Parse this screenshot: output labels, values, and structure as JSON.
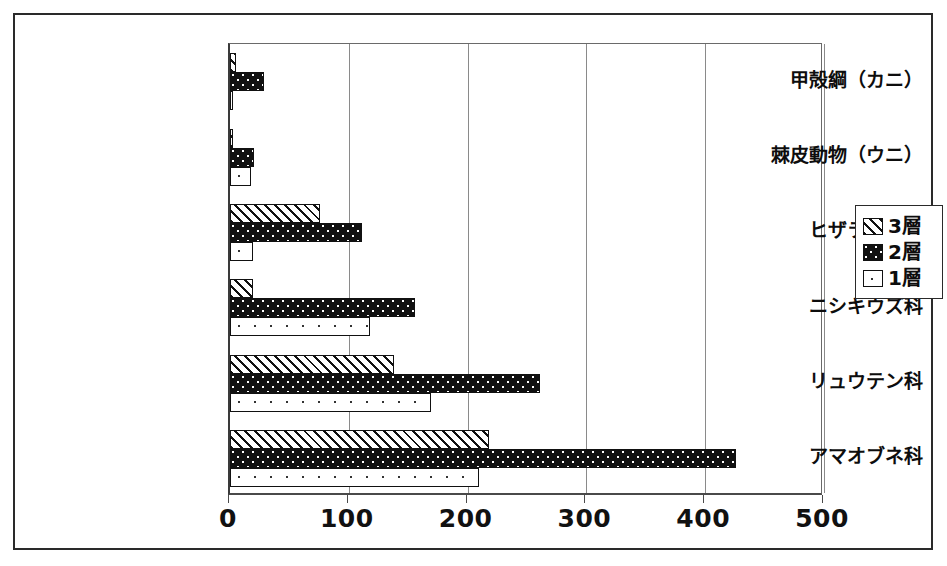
{
  "chart_data": {
    "type": "bar",
    "orientation": "horizontal",
    "title": "",
    "xlabel": "",
    "ylabel": "",
    "xlim": [
      0,
      500
    ],
    "xticks": [
      0,
      100,
      200,
      300,
      400,
      500
    ],
    "xtick_labels": [
      "0",
      "100",
      "200",
      "300",
      "400",
      "500"
    ],
    "grid": true,
    "grid_axis": "x",
    "legend_position": "right",
    "categories": [
      "甲殻綱（カニ）",
      "棘皮動物（ウニ）",
      "ヒザラガイ科",
      "ニシキウズ科",
      "リュウテン科",
      "アマオブネ科"
    ],
    "series": [
      {
        "name": "3層",
        "pattern": "diagonal-hatch",
        "values": [
          5,
          2,
          76,
          19,
          138,
          218
        ]
      },
      {
        "name": "2層",
        "pattern": "black-dotted",
        "values": [
          29,
          20,
          111,
          156,
          261,
          426
        ]
      },
      {
        "name": "1層",
        "pattern": "white-sparse-dots",
        "values": [
          2,
          18,
          19,
          118,
          169,
          210
        ]
      }
    ]
  },
  "legend": {
    "items": [
      {
        "label": "3層",
        "pattern": "diagonal-hatch"
      },
      {
        "label": "2層",
        "pattern": "black-dotted"
      },
      {
        "label": "1層",
        "pattern": "white-sparse-dots"
      }
    ]
  },
  "colors": {
    "ink": "#111111",
    "paper": "#ffffff",
    "grid": "#8a8a8a",
    "frame": "#2a2a2a"
  }
}
